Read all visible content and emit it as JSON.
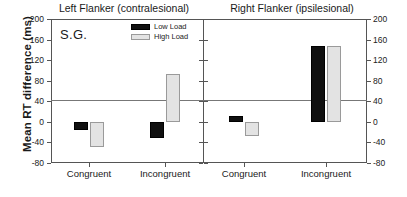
{
  "chart_data": {
    "type": "bar",
    "title": "",
    "subject": "S.G.",
    "ylabel": "Mean RT difference (ms)",
    "xlabel": "",
    "ylim": [
      -80,
      200
    ],
    "yticks": [
      200,
      160,
      120,
      80,
      40,
      0,
      -40,
      -80
    ],
    "ytick_labels": [
      "200",
      "160",
      "120",
      "80",
      "40",
      "0",
      "-40",
      "-80"
    ],
    "grid": false,
    "zero_line": 0,
    "categories": [
      "Congruent",
      "Incongruent"
    ],
    "legend": {
      "position": "top-right-of-left-panel",
      "entries": [
        {
          "name": "Low Load",
          "color": "#101010"
        },
        {
          "name": "High Load",
          "color": "#e3e3e3"
        }
      ]
    },
    "panels": [
      {
        "title": "Left Flanker (contralesional)",
        "categories": [
          "Congruent",
          "Incongruent"
        ],
        "series": [
          {
            "name": "Low Load",
            "values": [
              -15,
              -31
            ]
          },
          {
            "name": "High Load",
            "values": [
              -48,
              93
            ]
          }
        ]
      },
      {
        "title": "Right Flanker (ipsilesional)",
        "categories": [
          "Congruent",
          "Incongruent"
        ],
        "series": [
          {
            "name": "Low Load",
            "values": [
              12,
              148
            ]
          },
          {
            "name": "High Load",
            "values": [
              -27,
              147
            ]
          }
        ]
      }
    ]
  }
}
